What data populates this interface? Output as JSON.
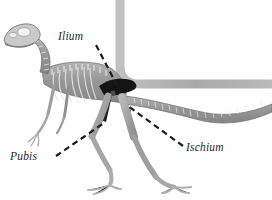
{
  "figure": {
    "background_color": "#ffffff"
  },
  "frame": {
    "name": "rounded-corner-band",
    "color": "#a9a9a9",
    "thickness": 9,
    "corner_radius": 26
  },
  "skeleton": {
    "body_color": "#9b9b9b",
    "body_outline_color": "#6e6e6e",
    "bone_highlight_color": "#ededed",
    "pelvis_color": "#141414",
    "parts": [
      "skull",
      "cervical-vertebrae",
      "dorsal-vertebrae",
      "ribcage",
      "forelimb",
      "pelvis",
      "hindlimb-near",
      "hindlimb-far",
      "caudal-vertebrae"
    ]
  },
  "labels": [
    {
      "id": "ilium",
      "text": "Ilium",
      "text_x": 58,
      "text_y": 40,
      "leader_from_x": 96,
      "leader_from_y": 45,
      "leader_to_x": 120,
      "leader_to_y": 91
    },
    {
      "id": "pubis",
      "text": "Pubis",
      "text_x": 10,
      "text_y": 160,
      "leader_from_x": 56,
      "leader_from_y": 156,
      "leader_to_x": 104,
      "leader_to_y": 123
    },
    {
      "id": "ischium",
      "text": "Ischium",
      "text_x": 186,
      "text_y": 151,
      "leader_from_x": 183,
      "leader_from_y": 146,
      "leader_to_x": 128,
      "leader_to_y": 106
    }
  ],
  "leader_line": {
    "color": "#1c1c1c",
    "width": 2.2,
    "dash": "6 4"
  },
  "caption": {
    "text": "",
    "color": "#d8d8d8"
  }
}
